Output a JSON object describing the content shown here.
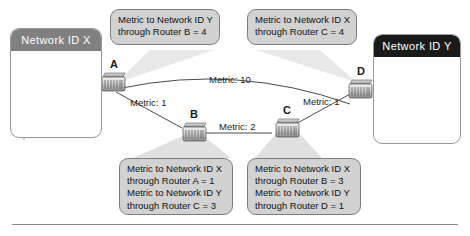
{
  "diagram": {
    "bottom_rule": true,
    "networks": [
      {
        "id": "net-x",
        "label": "Network ID X",
        "header_color": "#808080",
        "host_count": 4,
        "host_icon": "computer-icon"
      },
      {
        "id": "net-y",
        "label": "Network ID Y",
        "header_color": "#1a1a1a",
        "host_count": 4,
        "host_icon": "computer-icon"
      }
    ],
    "routers": [
      {
        "id": "router-a",
        "label": "A"
      },
      {
        "id": "router-b",
        "label": "B"
      },
      {
        "id": "router-c",
        "label": "C"
      },
      {
        "id": "router-d",
        "label": "D"
      }
    ],
    "links": [
      {
        "id": "link-a-d",
        "label": "Metric: 10",
        "from": "A",
        "to": "D",
        "metric": 10
      },
      {
        "id": "link-a-b",
        "label": "Metric: 1",
        "from": "A",
        "to": "B",
        "metric": 1
      },
      {
        "id": "link-b-c",
        "label": "Metric: 2",
        "from": "B",
        "to": "C",
        "metric": 2
      },
      {
        "id": "link-c-d",
        "label": "Metric: 1",
        "from": "C",
        "to": "D",
        "metric": 1
      }
    ],
    "callouts": [
      {
        "id": "callout-router-a",
        "source_router": "A",
        "lines": [
          "Metric to Network ID Y",
          "through Router B = 4"
        ]
      },
      {
        "id": "callout-router-d",
        "source_router": "D",
        "lines": [
          "Metric to Network ID X",
          "through Router C = 4"
        ]
      },
      {
        "id": "callout-router-b",
        "source_router": "B",
        "lines": [
          "Metric to Network ID X",
          "through Router A = 1",
          "Metric to Network ID Y",
          "through Router C = 3"
        ]
      },
      {
        "id": "callout-router-c",
        "source_router": "C",
        "lines": [
          "Metric to Network ID X",
          "through Router B = 3",
          "Metric to Network ID Y",
          "through Router D = 1"
        ]
      }
    ]
  },
  "colors": {
    "callout_fill": "#d2d2d2",
    "callout_border": "#7d7d7d",
    "cone_fill": "#e6e6e6",
    "link_stroke": "#555555",
    "net_x_header": "#808080",
    "net_y_header": "#1a1a1a",
    "box_border": "#9a9a9a",
    "rule": "#8a8a8a"
  }
}
